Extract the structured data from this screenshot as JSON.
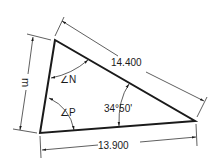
{
  "diagram": {
    "type": "triangle-dimensioned",
    "vertices": {
      "top": [
        55,
        40
      ],
      "bottom_left": [
        40,
        133
      ],
      "right": [
        195,
        121
      ]
    },
    "labels": {
      "hypotenuse": "14.400",
      "base": "13.900",
      "left_side": "m",
      "angle_top": "∠N",
      "angle_bottom_left": "∠P",
      "angle_right": "34°50'"
    },
    "colors": {
      "stroke": "#1a1a1a",
      "background": "#ffffff"
    }
  }
}
